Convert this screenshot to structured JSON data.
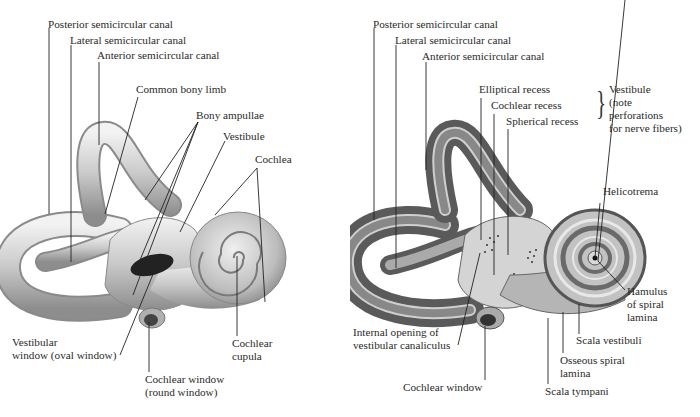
{
  "figure": {
    "panels": [
      {
        "id": "bony-labyrinth-exterior",
        "labels": {
          "posterior_canal": "Posterior semicircular canal",
          "lateral_canal": "Lateral semicircular canal",
          "anterior_canal": "Anterior semicircular canal",
          "common_limb": "Common bony limb",
          "ampullae": "Bony ampullae",
          "vestibule": "Vestibule",
          "cochlea": "Cochlea",
          "vestibular_window_1": "Vestibular",
          "vestibular_window_2": "window (oval window)",
          "cochlear_window_1": "Cochlear window",
          "cochlear_window_2": "(round window)",
          "cochlear_cupula_1": "Cochlear",
          "cochlear_cupula_2": "cupula"
        }
      },
      {
        "id": "bony-labyrinth-opened",
        "labels": {
          "posterior_canal": "Posterior semicircular canal",
          "lateral_canal": "Lateral semicircular canal",
          "anterior_canal": "Anterior semicircular canal",
          "elliptical_recess": "Elliptical recess",
          "cochlear_recess": "Cochlear recess",
          "spherical_recess": "Spherical recess",
          "vestibule_note_1": "Vestibule",
          "vestibule_note_2": "(note",
          "vestibule_note_3": "perforations",
          "vestibule_note_4": "for nerve fibers)",
          "helicotrema": "Helicotrema",
          "hamulus_1": "Hamulus",
          "hamulus_2": "of spiral",
          "hamulus_3": "lamina",
          "scala_vestibuli": "Scala vestibuli",
          "osseous_lamina_1": "Osseous spiral",
          "osseous_lamina_2": "lamina",
          "scala_tympani": "Scala tympani",
          "cochlear_window": "Cochlear window",
          "internal_opening_1": "Internal opening of",
          "internal_opening_2": "vestibular canaliculus"
        }
      }
    ]
  }
}
